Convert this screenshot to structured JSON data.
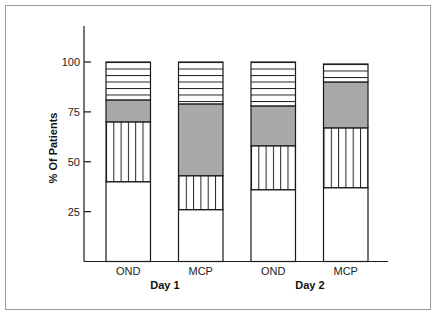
{
  "chart_data": {
    "type": "bar",
    "stacked": true,
    "title": "",
    "xlabel": "",
    "ylabel": "% Of Patients",
    "ylim": [
      0,
      115
    ],
    "yticks": [
      25,
      50,
      75,
      100
    ],
    "grid": false,
    "legend": null,
    "groups": [
      "Day 1",
      "Day 2"
    ],
    "categories": [
      "OND",
      "MCP",
      "OND",
      "MCP"
    ],
    "category_groups": [
      "Day 1",
      "Day 1",
      "Day 2",
      "Day 2"
    ],
    "series": [
      {
        "name": "Segment 1 (blank)",
        "pattern": "none",
        "values": [
          40,
          26,
          36,
          37
        ]
      },
      {
        "name": "Segment 2 (vertical lines)",
        "pattern": "vertical-lines",
        "values": [
          30,
          17,
          22,
          30
        ]
      },
      {
        "name": "Segment 3 (gray)",
        "pattern": "solid-gray",
        "values": [
          11,
          36,
          20,
          23
        ]
      },
      {
        "name": "Segment 4 (horizontal lines)",
        "pattern": "horizontal-lines",
        "values": [
          19,
          21,
          22,
          9
        ]
      }
    ],
    "totals": [
      100,
      100,
      100,
      99
    ]
  },
  "axis": {
    "ylabel": "% Of Patients",
    "ticks": [
      "25",
      "50",
      "75",
      "100"
    ]
  },
  "xaxis": {
    "categories": [
      "OND",
      "MCP",
      "OND",
      "MCP"
    ],
    "groups": [
      "Day 1",
      "Day 2"
    ]
  },
  "colors": {
    "gray_fill": "#a9a9a9",
    "stroke": "#1a1a1a",
    "frame": "#9a9a9a"
  }
}
